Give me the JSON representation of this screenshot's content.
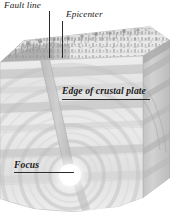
{
  "figure": {
    "type": "cutaway-block-diagram",
    "width": 183,
    "height": 221,
    "background_color": "#ffffff",
    "ink_color": "#2b2b2b",
    "palette": {
      "terrain_light": "#f2f2f2",
      "terrain_mid": "#dcdcdc",
      "terrain_dark": "#b4b4b4",
      "rock_light": "#eaeaea",
      "rock_mid": "#d4d4d4",
      "rock_dark": "#bdbdbd",
      "side_face": "#c9c9c9",
      "wave_stroke": "#c2c2c2",
      "focus_glow": "#ffffff"
    }
  },
  "labels": [
    {
      "id": "fault-line",
      "text": "Fault line",
      "style": "italic",
      "weight": "regular",
      "leader": "vertical"
    },
    {
      "id": "epicenter",
      "text": "Epicenter",
      "style": "italic",
      "weight": "regular",
      "leader": "vertical"
    },
    {
      "id": "edge-of-crustal-plate",
      "text": "Edge of crustal plate",
      "style": "italic",
      "weight": "bold",
      "leader": "horizontal"
    },
    {
      "id": "focus",
      "text": "Focus",
      "style": "italic",
      "weight": "bold",
      "leader": "horizontal"
    }
  ],
  "features": {
    "top_surface": "vegetated terrain with scattered trees and shrubs",
    "front_face": "rock strata cross-section with concentric seismic waves",
    "right_face": "angled rock strata side panel",
    "fault_plane": "narrow vertical fault band from surface to focus",
    "focus_point": "bright glowing hypocenter",
    "seismic_waves": "concentric circular wavefronts radiating from focus",
    "strata_band_count": 6,
    "wave_ring_count": 5
  }
}
